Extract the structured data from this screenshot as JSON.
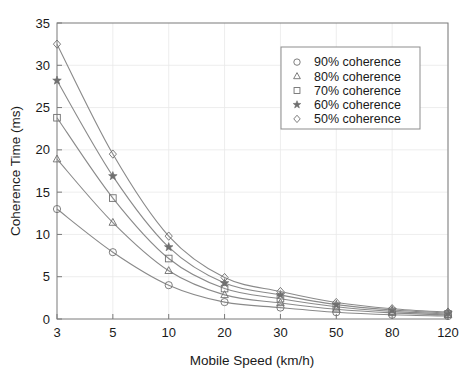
{
  "chart_data": {
    "type": "line",
    "title": "",
    "xlabel": "Mobile Speed (km/h)",
    "ylabel": "Coherence Time (ms)",
    "x_ticklabels": [
      "3",
      "5",
      "10",
      "20",
      "30",
      "50",
      "80",
      "120"
    ],
    "x_values": [
      3,
      5,
      10,
      20,
      30,
      50,
      80,
      120
    ],
    "x_axis_scale": "categorical-evenly-spaced",
    "y_ticklabels": [
      "0",
      "5",
      "10",
      "15",
      "20",
      "25",
      "30",
      "35"
    ],
    "y_ticks": [
      0,
      5,
      10,
      15,
      20,
      25,
      30,
      35
    ],
    "ylim": [
      0,
      35
    ],
    "grid": true,
    "legend_position": "upper-right",
    "series": [
      {
        "name": "90% coherence",
        "marker": "circle",
        "values": [
          13.0,
          7.9,
          4.0,
          2.0,
          1.35,
          0.8,
          0.5,
          0.35
        ]
      },
      {
        "name": "80% coherence",
        "marker": "triangle",
        "values": [
          18.9,
          11.4,
          5.7,
          2.85,
          1.9,
          1.15,
          0.72,
          0.48
        ]
      },
      {
        "name": "70% coherence",
        "marker": "square",
        "values": [
          23.8,
          14.3,
          7.15,
          3.6,
          2.4,
          1.45,
          0.9,
          0.6
        ]
      },
      {
        "name": "60% coherence",
        "marker": "star",
        "values": [
          28.2,
          16.9,
          8.5,
          4.25,
          2.85,
          1.7,
          1.06,
          0.71
        ]
      },
      {
        "name": "50% coherence",
        "marker": "diamond",
        "values": [
          32.5,
          19.5,
          9.8,
          4.9,
          3.25,
          1.95,
          1.22,
          0.82
        ]
      }
    ]
  },
  "legend": {
    "entries": [
      {
        "label": "90% coherence",
        "marker": "circle"
      },
      {
        "label": "80% coherence",
        "marker": "triangle"
      },
      {
        "label": "70% coherence",
        "marker": "square"
      },
      {
        "label": "60% coherence",
        "marker": "star"
      },
      {
        "label": "50% coherence",
        "marker": "diamond"
      }
    ]
  },
  "colors": {
    "line": "#8a8a8a",
    "marker": "#6f6f6f",
    "axis": "#7a7a7a",
    "grid": "#e8e8e8",
    "text": "#1a1a1a",
    "background": "#ffffff"
  }
}
